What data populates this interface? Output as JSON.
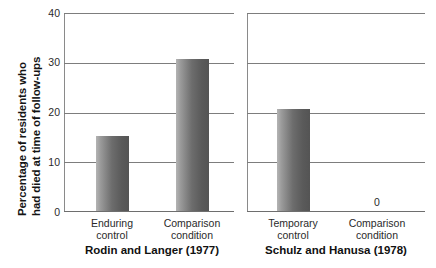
{
  "chart_data": {
    "type": "bar",
    "title": "",
    "xlabel": "",
    "ylabel_line1": "Percentage of residents who",
    "ylabel_line2": "had died at time of follow-ups",
    "ylim": [
      0,
      40
    ],
    "yticks": [
      "0",
      "10",
      "20",
      "30",
      "40"
    ],
    "ytick_values": [
      0,
      10,
      20,
      30,
      40
    ],
    "grid": "horizontal",
    "legend": "none",
    "panels": [
      {
        "title": "Rodin and Langer (1977)",
        "categories": [
          "Enduring control",
          "Comparison condition"
        ],
        "category_lines": [
          [
            "Enduring",
            "control"
          ],
          [
            "Comparison",
            "condition"
          ]
        ],
        "values": [
          15,
          30.5
        ],
        "value_labels": [
          "",
          ""
        ]
      },
      {
        "title": "Schulz and Hanusa (1978)",
        "categories": [
          "Temporary control",
          "Comparison condition"
        ],
        "category_lines": [
          [
            "Temporary",
            "control"
          ],
          [
            "Comparison",
            "condition"
          ]
        ],
        "values": [
          20.5,
          0
        ],
        "value_labels": [
          "",
          "0"
        ]
      }
    ],
    "bar_color_light": "#b4b4b4",
    "bar_color_dark": "#545454",
    "axis_color": "#6e6e6e",
    "grid_color": "#7d7d7d",
    "background": "#ffffff"
  }
}
